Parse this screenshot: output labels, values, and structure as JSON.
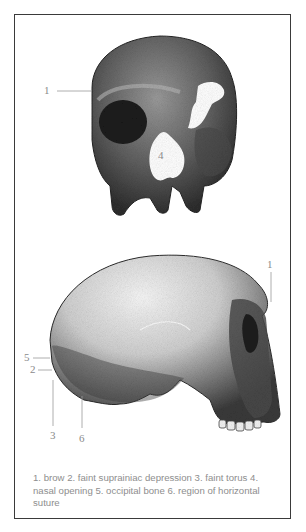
{
  "figure": {
    "frame_color": "#3a3a3a",
    "skull_front": {
      "name": "frontal view of skull",
      "labels": [
        {
          "num": "1",
          "x": 44,
          "y": 86
        },
        {
          "num": "4",
          "x": 161,
          "y": 150
        }
      ]
    },
    "skull_side": {
      "name": "lateral view of skull",
      "labels": [
        {
          "num": "1",
          "x": 267,
          "y": 260
        },
        {
          "num": "5",
          "x": 23,
          "y": 353
        },
        {
          "num": "2",
          "x": 30,
          "y": 365
        },
        {
          "num": "3",
          "x": 49,
          "y": 431
        },
        {
          "num": "6",
          "x": 79,
          "y": 434
        }
      ]
    },
    "caption": "1. brow 2. faint suprainiac depression 3. faint torus 4. nasal opening 5. occipital bone 6. region of horizontal suture"
  }
}
